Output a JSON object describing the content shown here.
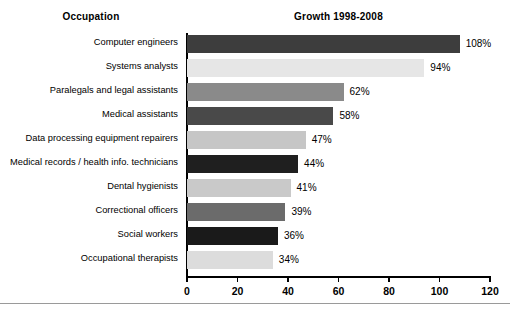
{
  "headers": {
    "left": "Occupation",
    "right": "Growth 1998-2008"
  },
  "axis": {
    "ticks": [
      "0",
      "20",
      "40",
      "60",
      "80",
      "100",
      "120"
    ]
  },
  "chart_data": {
    "type": "bar",
    "orientation": "horizontal",
    "title": "Growth 1998-2008",
    "xlabel": "",
    "ylabel": "Occupation",
    "xlim": [
      0,
      120
    ],
    "xticks": [
      0,
      20,
      40,
      60,
      80,
      100,
      120
    ],
    "grid": false,
    "legend": "none",
    "value_suffix": "%",
    "categories": [
      "Computer engineers",
      "Systems analysts",
      "Paralegals and legal assistants",
      "Medical assistants",
      "Data processing equipment repairers",
      "Medical records / health info. technicians",
      "Dental hygienists",
      "Correctional officers",
      "Social workers",
      "Occupational therapists"
    ],
    "values": [
      108,
      94,
      62,
      58,
      47,
      44,
      41,
      39,
      36,
      34
    ],
    "data_labels": [
      "108%",
      "94%",
      "62%",
      "58%",
      "47%",
      "44%",
      "41%",
      "39%",
      "36%",
      "34%"
    ],
    "bar_colors": [
      "#3d3d3d",
      "#e6e6e6",
      "#8a8a8a",
      "#494949",
      "#c6c6c6",
      "#1f1f1f",
      "#c9c9c9",
      "#6b6b6b",
      "#1a1a1a",
      "#dcdcdc"
    ]
  }
}
